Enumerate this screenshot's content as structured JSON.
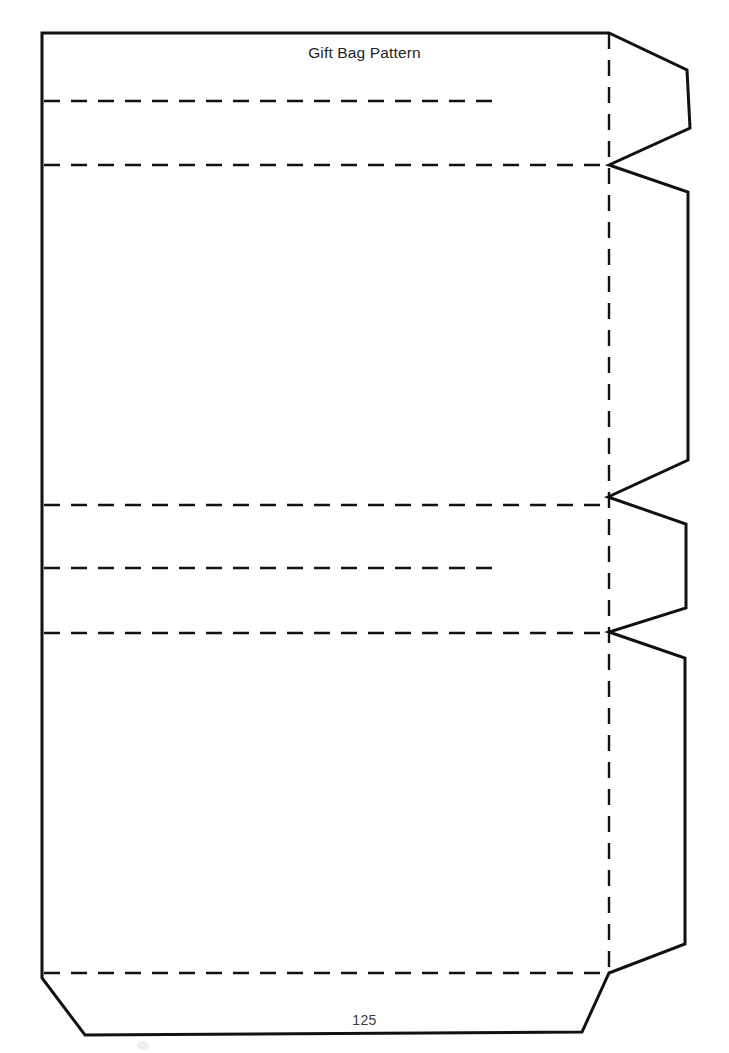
{
  "document": {
    "title": "Gift Bag Pattern",
    "page_number": "125",
    "background_color": "#ffffff",
    "line_color": "#111111",
    "text_color": "#242424"
  },
  "pattern": {
    "name": "gift-bag-pattern",
    "description": "Flat die-cut template for a folded gift bag with glue tab flaps on the right edge and a bottom flap.",
    "solid_outline_label": "cut line",
    "dashed_line_label": "fold line",
    "cut_lines": {
      "stroke_width": 3,
      "color": "#111111",
      "outline_points": "42,33 609,33 687,70 690,128 609,165 688,192 688,460 608,497 686,524 686,608 609,632 685,658 685,944 609,973 582,1032 85,1035 42,978",
      "segments": [
        {
          "name": "top-edge",
          "from": [
            42,
            33
          ],
          "to": [
            609,
            33
          ]
        },
        {
          "name": "upper-tab-top-diagonal",
          "from": [
            609,
            33
          ],
          "to": [
            687,
            70
          ]
        },
        {
          "name": "upper-tab-right-edge",
          "from": [
            687,
            70
          ],
          "to": [
            690,
            128
          ]
        },
        {
          "name": "upper-tab-bottom-diagonal",
          "from": [
            690,
            128
          ],
          "to": [
            609,
            165
          ]
        },
        {
          "name": "middle-tab-top-diagonal",
          "from": [
            609,
            165
          ],
          "to": [
            688,
            192
          ]
        },
        {
          "name": "middle-tab-right-edge",
          "from": [
            688,
            192
          ],
          "to": [
            688,
            460
          ]
        },
        {
          "name": "middle-tab-bottom-diagonal",
          "from": [
            688,
            460
          ],
          "to": [
            608,
            497
          ]
        },
        {
          "name": "small-tab-top-diagonal",
          "from": [
            608,
            497
          ],
          "to": [
            686,
            524
          ]
        },
        {
          "name": "small-tab-right-edge",
          "from": [
            686,
            524
          ],
          "to": [
            686,
            608
          ]
        },
        {
          "name": "small-tab-bottom-diagonal",
          "from": [
            686,
            608
          ],
          "to": [
            609,
            632
          ]
        },
        {
          "name": "lower-tab-top-diagonal",
          "from": [
            609,
            632
          ],
          "to": [
            685,
            658
          ]
        },
        {
          "name": "lower-tab-right-edge",
          "from": [
            685,
            658
          ],
          "to": [
            685,
            944
          ]
        },
        {
          "name": "lower-tab-bottom-diagonal",
          "from": [
            685,
            944
          ],
          "to": [
            609,
            973
          ]
        },
        {
          "name": "bottom-flap-right-diagonal",
          "from": [
            609,
            973
          ],
          "to": [
            582,
            1032
          ]
        },
        {
          "name": "bottom-flap-edge",
          "from": [
            582,
            1032
          ],
          "to": [
            85,
            1035
          ]
        },
        {
          "name": "bottom-flap-left-diagonal",
          "from": [
            85,
            1035
          ],
          "to": [
            42,
            978
          ]
        },
        {
          "name": "left-edge",
          "from": [
            42,
            978
          ],
          "to": [
            42,
            33
          ]
        }
      ]
    },
    "fold_lines": {
      "stroke_width": 2.4,
      "color": "#111111",
      "dash_pattern": "16 11",
      "horizontal": [
        {
          "name": "fold-top-short",
          "y": 101,
          "x1": 44,
          "x2": 503,
          "length_type": "short"
        },
        {
          "name": "fold-upper-full",
          "y": 165,
          "x1": 44,
          "x2": 609,
          "length_type": "full"
        },
        {
          "name": "fold-mid-upper-full",
          "y": 505,
          "x1": 44,
          "x2": 609,
          "length_type": "full"
        },
        {
          "name": "fold-mid-short",
          "y": 568,
          "x1": 44,
          "x2": 503,
          "length_type": "short"
        },
        {
          "name": "fold-mid-lower-full",
          "y": 633,
          "x1": 44,
          "x2": 609,
          "length_type": "full"
        },
        {
          "name": "fold-bottom-full",
          "y": 973,
          "x1": 44,
          "x2": 609,
          "length_type": "full"
        }
      ],
      "vertical": [
        {
          "name": "fold-right-vertical",
          "x": 609,
          "y1": 33,
          "y2": 973
        }
      ]
    },
    "panels": [
      {
        "name": "panel-top-hem",
        "top": 33,
        "bottom": 101
      },
      {
        "name": "panel-upper-fold",
        "top": 101,
        "bottom": 165
      },
      {
        "name": "panel-front",
        "top": 165,
        "bottom": 505
      },
      {
        "name": "panel-gusset-upper",
        "top": 505,
        "bottom": 568
      },
      {
        "name": "panel-gusset-lower",
        "top": 568,
        "bottom": 633
      },
      {
        "name": "panel-back",
        "top": 633,
        "bottom": 973
      },
      {
        "name": "panel-bottom-flap",
        "top": 973,
        "bottom": 1035
      }
    ]
  }
}
